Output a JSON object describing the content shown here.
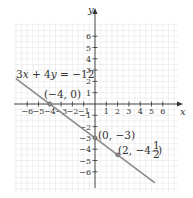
{
  "chart_data": {
    "type": "line",
    "title": "",
    "xlabel": "x",
    "ylabel": "y",
    "xlim": [
      -7,
      7
    ],
    "ylim": [
      -7.5,
      7
    ],
    "grid": true,
    "x_ticks": [
      -6,
      -5,
      -4,
      -3,
      -2,
      -1,
      1,
      2,
      3,
      4,
      5,
      6
    ],
    "y_ticks": [
      -6,
      -5,
      -4,
      -3,
      -2,
      -1,
      1,
      2,
      3,
      4,
      5,
      6
    ],
    "x_tick_labels": [
      "−6",
      "−5",
      "−4",
      "−3",
      "−2",
      "−1",
      "1",
      "2",
      "3",
      "4",
      "5",
      "6"
    ],
    "y_tick_labels": [
      "−6",
      "−5",
      "−4",
      "−3",
      "−2",
      "−1",
      "1",
      "2",
      "3",
      "4",
      "5",
      "6"
    ],
    "series": [
      {
        "name": "3x + 4y = −12",
        "equation": "3x + 4y = −12",
        "x": [
          -7,
          5.3
        ],
        "y": [
          2.25,
          -6.975
        ],
        "color": "#8a8a8a"
      }
    ],
    "points": [
      {
        "x": -4,
        "y": 0,
        "label": "(−4, 0)"
      },
      {
        "x": 0,
        "y": -3,
        "label": "(0, −3)"
      },
      {
        "x": 2,
        "y": -4.5,
        "label": "(2, −4½)"
      }
    ],
    "annotations": [
      {
        "text": "3x + 4y = −12",
        "anchor": "upper-left of line"
      },
      {
        "text": "(−4, 0)",
        "anchor": "above x-intercept"
      },
      {
        "text": "(0, −3)",
        "anchor": "right of y-intercept"
      },
      {
        "text": "(2, −4½)",
        "anchor": "right of point (2, −4.5)"
      }
    ]
  },
  "labels": {
    "x_axis": "x",
    "y_axis": "y",
    "equation_part1": "3",
    "equation_x": "x",
    "equation_part2": " + 4",
    "equation_y": "y",
    "equation_part3": " = −12",
    "pt1": "(−4, 0)",
    "pt2": "(0, −3)",
    "pt3_open": "(2, −4",
    "pt3_num": "1",
    "pt3_den": "2",
    "pt3_close": ")"
  },
  "colors": {
    "grid": "#e6e6e6",
    "axis": "#333333",
    "line": "#8a8a8a",
    "point": "#8a8a8a"
  }
}
